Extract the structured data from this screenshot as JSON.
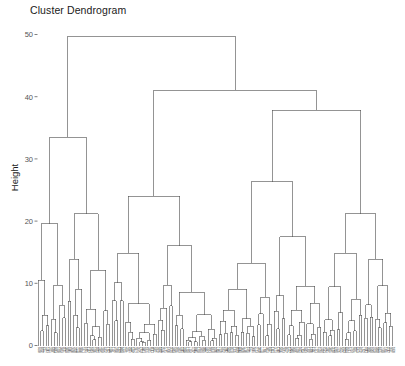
{
  "chart_data": {
    "type": "dendrogram",
    "title": "Cluster Dendrogram",
    "xlabel": "",
    "ylabel": "Height",
    "ylim": [
      0,
      52
    ],
    "yticks": [
      0,
      10,
      20,
      30,
      40,
      50
    ],
    "ytick_labels": [
      "0",
      "10",
      "20",
      "30",
      "40",
      "50"
    ],
    "grid": false,
    "legend": false,
    "n_leaves": 186,
    "orientation": "top",
    "line_color": "#4d4d4d",
    "background_color": "#ffffff",
    "root_height": 49.7,
    "merges": [
      {
        "id": "root",
        "height": 49.7,
        "x": 0.215,
        "left": "L",
        "right": "R"
      },
      {
        "id": "L",
        "height": 33.5,
        "x": 0.073,
        "left": "L1",
        "right": "L2"
      },
      {
        "id": "R",
        "height": 41.0,
        "x": 0.357,
        "left": "R1",
        "right": "R2"
      },
      {
        "id": "R1",
        "height": 24.0,
        "x": 0.24,
        "left": "R1a",
        "right": "R1b"
      },
      {
        "id": "R2",
        "height": 37.8,
        "x": 0.474,
        "left": "R2a",
        "right": "R2b"
      },
      {
        "id": "R2b",
        "height": 26.3,
        "x": 0.57,
        "left": "R2b1",
        "right": "R2b2"
      }
    ],
    "cluster_heights": [
      49.7,
      41.0,
      37.8,
      33.5,
      26.3,
      24.0,
      21.2,
      19.6,
      18.4,
      17.5,
      16.0,
      14.8,
      13.2,
      12.1,
      11.0,
      10.2,
      9.4,
      8.6,
      7.8,
      6.9,
      6.1,
      5.4,
      4.6,
      3.9,
      3.1,
      2.4,
      1.7,
      1.1,
      0.6
    ],
    "leaf_label_note": "Leaf labels are printed but too small to be legible at this resolution"
  },
  "axis": {
    "y_title": "Height",
    "tick_0": "0",
    "tick_10": "10",
    "tick_20": "20",
    "tick_30": "30",
    "tick_40": "40",
    "tick_50": "50"
  }
}
